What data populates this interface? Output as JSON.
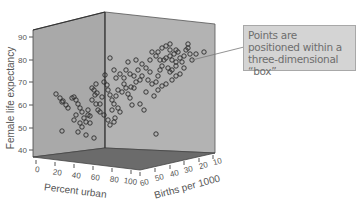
{
  "chart_data": {
    "type": "scatter",
    "subtype": "3d-scatter",
    "title": "",
    "axes": {
      "y": {
        "label": "Female life expectancy",
        "ticks": [
          40,
          50,
          60,
          70,
          80,
          90
        ],
        "range": [
          37,
          93
        ]
      },
      "x": {
        "label": "Percent urban",
        "ticks": [
          0,
          20,
          40,
          60,
          80,
          100
        ],
        "range": [
          0,
          100
        ]
      },
      "z": {
        "label": "Births per 1000",
        "ticks": [
          60,
          50,
          40,
          30,
          20,
          10
        ],
        "range": [
          60,
          10
        ]
      }
    },
    "grid": false,
    "marker": "open-circle",
    "annotation": "Points are positioned within a three-dimensional “box”",
    "points_screen": [
      [
        56,
        94
      ],
      [
        60,
        98
      ],
      [
        62,
        102
      ],
      [
        63,
        101
      ],
      [
        66,
        105
      ],
      [
        68,
        108
      ],
      [
        72,
        98
      ],
      [
        74,
        97
      ],
      [
        76,
        100
      ],
      [
        78,
        104
      ],
      [
        80,
        108
      ],
      [
        82,
        112
      ],
      [
        76,
        115
      ],
      [
        74,
        120
      ],
      [
        80,
        123
      ],
      [
        84,
        118
      ],
      [
        86,
        122
      ],
      [
        88,
        115
      ],
      [
        90,
        116
      ],
      [
        82,
        127
      ],
      [
        78,
        132
      ],
      [
        86,
        135
      ],
      [
        62,
        131
      ],
      [
        94,
        138
      ],
      [
        90,
        123
      ],
      [
        88,
        110
      ],
      [
        92,
        100
      ],
      [
        96,
        104
      ],
      [
        98,
        110
      ],
      [
        100,
        112
      ],
      [
        95,
        95
      ],
      [
        97,
        93
      ],
      [
        102,
        97
      ],
      [
        100,
        104
      ],
      [
        92,
        88
      ],
      [
        94,
        90
      ],
      [
        96,
        84
      ],
      [
        104,
        82
      ],
      [
        105,
        75
      ],
      [
        107,
        85
      ],
      [
        108,
        90
      ],
      [
        110,
        95
      ],
      [
        112,
        100
      ],
      [
        114,
        104
      ],
      [
        112,
        110
      ],
      [
        115,
        118
      ],
      [
        104,
        115
      ],
      [
        108,
        120
      ],
      [
        110,
        125
      ],
      [
        118,
        108
      ],
      [
        120,
        112
      ],
      [
        116,
        96
      ],
      [
        118,
        90
      ],
      [
        122,
        92
      ],
      [
        124,
        84
      ],
      [
        126,
        88
      ],
      [
        128,
        94
      ],
      [
        130,
        98
      ],
      [
        132,
        105
      ],
      [
        134,
        88
      ],
      [
        136,
        82
      ],
      [
        140,
        80
      ],
      [
        142,
        76
      ],
      [
        138,
        70
      ],
      [
        142,
        64
      ],
      [
        146,
        68
      ],
      [
        150,
        72
      ],
      [
        148,
        80
      ],
      [
        152,
        84
      ],
      [
        156,
        82
      ],
      [
        158,
        76
      ],
      [
        160,
        70
      ],
      [
        162,
        66
      ],
      [
        164,
        60
      ],
      [
        166,
        58
      ],
      [
        170,
        56
      ],
      [
        172,
        60
      ],
      [
        174,
        54
      ],
      [
        176,
        50
      ],
      [
        178,
        52
      ],
      [
        180,
        58
      ],
      [
        182,
        62
      ],
      [
        184,
        56
      ],
      [
        186,
        50
      ],
      [
        188,
        48
      ],
      [
        190,
        54
      ],
      [
        192,
        60
      ],
      [
        176,
        66
      ],
      [
        172,
        70
      ],
      [
        168,
        68
      ],
      [
        160,
        60
      ],
      [
        156,
        56
      ],
      [
        158,
        52
      ],
      [
        162,
        48
      ],
      [
        166,
        46
      ],
      [
        170,
        50
      ],
      [
        150,
        60
      ],
      [
        152,
        52
      ],
      [
        136,
        60
      ],
      [
        128,
        62
      ],
      [
        126,
        70
      ],
      [
        120,
        74
      ],
      [
        124,
        78
      ],
      [
        114,
        70
      ],
      [
        116,
        78
      ],
      [
        130,
        74
      ],
      [
        134,
        76
      ],
      [
        146,
        92
      ],
      [
        140,
        104
      ],
      [
        144,
        110
      ],
      [
        154,
        96
      ],
      [
        158,
        90
      ],
      [
        162,
        86
      ],
      [
        166,
        84
      ],
      [
        172,
        80
      ],
      [
        176,
        76
      ],
      [
        180,
        74
      ],
      [
        170,
        72
      ],
      [
        176,
        62
      ],
      [
        184,
        68
      ],
      [
        188,
        44
      ],
      [
        196,
        54
      ],
      [
        204,
        52
      ],
      [
        170,
        44
      ],
      [
        110,
        58
      ],
      [
        131,
        87
      ],
      [
        156,
        134
      ],
      [
        114,
        122
      ]
    ]
  }
}
